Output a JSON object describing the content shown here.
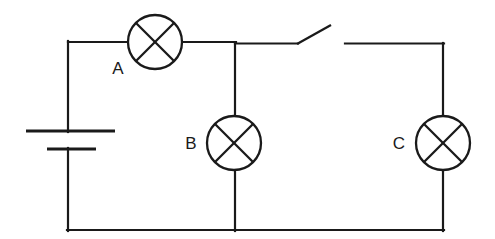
{
  "diagram": {
    "type": "circuit-schematic",
    "background_color": "#ffffff",
    "line_color": "#1a1a1a",
    "line_width": 2.2,
    "canvas": {
      "width": 495,
      "height": 239
    }
  },
  "components": {
    "battery": {
      "name": "battery",
      "long_plate": {
        "x1": 26,
        "y1": 131,
        "x2": 115,
        "y2": 131
      },
      "short_plate": {
        "x1": 47,
        "y1": 149,
        "x2": 96,
        "y2": 149
      }
    },
    "lamps": [
      {
        "label": "A",
        "cx": 155,
        "cy": 42,
        "r": 27,
        "label_x": 118,
        "label_y": 70,
        "orientation": "horizontal"
      },
      {
        "label": "B",
        "cx": 234,
        "cy": 143,
        "r": 27,
        "label_x": 191,
        "label_y": 145,
        "orientation": "vertical"
      },
      {
        "label": "C",
        "cx": 443,
        "cy": 143,
        "r": 27,
        "label_x": 399,
        "label_y": 145,
        "orientation": "vertical"
      }
    ],
    "switch": {
      "name": "open-switch",
      "state": "open",
      "pivot_x": 297,
      "pivot_y": 44,
      "blade_tip_x": 331,
      "blade_tip_y": 25,
      "right_contact_x": 345
    }
  },
  "wires": {
    "top_left_to_lampA": {
      "x1": 68,
      "y1": 42,
      "x2": 128,
      "y2": 42
    },
    "lampA_to_junction": {
      "x1": 182,
      "y1": 42,
      "x2": 235,
      "y2": 42
    },
    "junction_to_switch_pivot": {
      "x1": 235,
      "y1": 44,
      "x2": 297,
      "y2": 44
    },
    "switch_right_to_corner": {
      "x1": 345,
      "y1": 44,
      "x2": 443,
      "y2": 44
    },
    "left_vertical_upper": {
      "x1": 68,
      "y1": 42,
      "x2": 68,
      "y2": 131
    },
    "left_vertical_lower": {
      "x1": 68,
      "y1": 149,
      "x2": 68,
      "y2": 230
    },
    "bottom": {
      "x1": 68,
      "y1": 230,
      "x2": 443,
      "y2": 230
    },
    "branch_B_top": {
      "x1": 235,
      "y1": 44,
      "x2": 235,
      "y2": 116
    },
    "branch_B_bottom": {
      "x1": 235,
      "y1": 170,
      "x2": 235,
      "y2": 230
    },
    "right_vertical_top": {
      "x1": 443,
      "y1": 44,
      "x2": 443,
      "y2": 116
    },
    "right_vertical_bottom": {
      "x1": 443,
      "y1": 170,
      "x2": 443,
      "y2": 230
    }
  }
}
